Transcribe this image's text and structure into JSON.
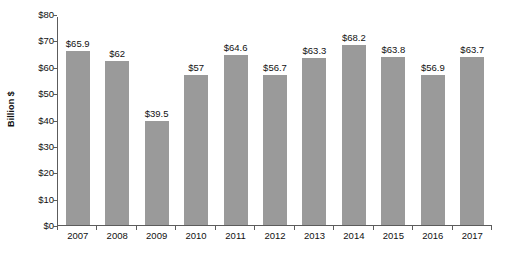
{
  "chart_data": {
    "type": "bar",
    "title": "",
    "subtitle": "",
    "xlabel": "",
    "ylabel": "Billion $",
    "categories": [
      "2007",
      "2008",
      "2009",
      "2010",
      "2011",
      "2012",
      "2013",
      "2014",
      "2015",
      "2016",
      "2017"
    ],
    "values": [
      65.9,
      62,
      39.5,
      57,
      64.6,
      56.7,
      63.3,
      68.2,
      63.8,
      56.9,
      63.7
    ],
    "data_labels": [
      "$65.9",
      "$62",
      "$39.5",
      "$57",
      "$64.6",
      "$56.7",
      "$63.3",
      "$68.2",
      "$63.8",
      "$56.9",
      "$63.7"
    ],
    "ylim": [
      0,
      80
    ],
    "ytick_values": [
      0,
      10,
      20,
      30,
      40,
      50,
      60,
      70,
      80
    ],
    "ytick_labels": [
      "$0",
      "$10",
      "$20",
      "$30",
      "$40",
      "$50",
      "$60",
      "$70",
      "$80"
    ],
    "grid": false,
    "legend": null,
    "legend_position": "none",
    "bar_color": "#9a9a9a",
    "axis_color": "#5c5c5c",
    "background_color": "#ffffff",
    "text_color": "#111111"
  }
}
